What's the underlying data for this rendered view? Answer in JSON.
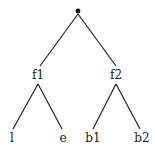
{
  "diagram": {
    "type": "tree",
    "root": {
      "label": "",
      "marker": "dot"
    },
    "nodes": {
      "f1": {
        "label": "f1"
      },
      "f2": {
        "label": "f2"
      },
      "l": {
        "label": "l"
      },
      "e": {
        "label": "e"
      },
      "b1": {
        "label": "b1"
      },
      "b2": {
        "label": "b2"
      }
    },
    "edges": [
      [
        "root",
        "f1"
      ],
      [
        "root",
        "f2"
      ],
      [
        "f1",
        "l"
      ],
      [
        "f1",
        "e"
      ],
      [
        "f2",
        "b1"
      ],
      [
        "f2",
        "b2"
      ]
    ],
    "colors": {
      "line": "#222222",
      "text": "#222222"
    }
  }
}
